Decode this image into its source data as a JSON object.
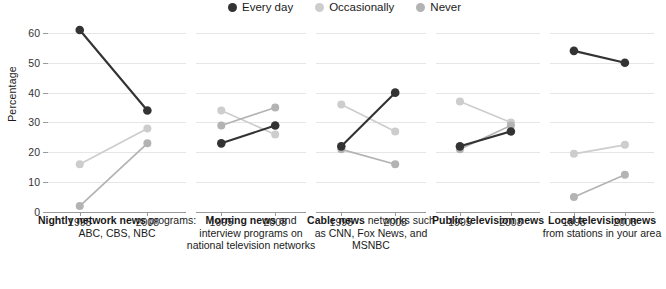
{
  "legend": {
    "items": [
      {
        "label": "Every day",
        "color": "#333333"
      },
      {
        "label": "Occasionally",
        "color": "#cdcdcd"
      },
      {
        "label": "Never",
        "color": "#b3b3b3"
      }
    ]
  },
  "axis": {
    "ylabel": "Percentage",
    "yticks": [
      "0",
      "10",
      "20",
      "30",
      "40",
      "50",
      "60"
    ],
    "xticks": [
      "1995",
      "2008"
    ]
  },
  "panels": [
    {
      "title": "Nightly network news",
      "subtitle": "programs: ABC, CBS, NBC"
    },
    {
      "title": "Morning news",
      "subtitle": "and interview programs on national television networks"
    },
    {
      "title": "Cable news",
      "subtitle": "networks such as CNN, Fox News, and MSNBC"
    },
    {
      "title": "Public television news",
      "subtitle": ""
    },
    {
      "title": "Local television news",
      "subtitle": "from stations in your area"
    }
  ],
  "chart_data": {
    "type": "line",
    "title": "",
    "xlabel": "",
    "ylabel": "Percentage",
    "ylim": [
      0,
      63
    ],
    "yticks": [
      0,
      10,
      20,
      30,
      40,
      50,
      60
    ],
    "x": [
      "1995",
      "2008"
    ],
    "grid": true,
    "legend_position": "top",
    "panels": [
      {
        "name": "Nightly network news programs: ABC, CBS, NBC",
        "series": [
          {
            "name": "Every day",
            "values": [
              61,
              34
            ],
            "color": "#333333"
          },
          {
            "name": "Occasionally",
            "values": [
              16,
              28
            ],
            "color": "#cdcdcd"
          },
          {
            "name": "Never",
            "values": [
              2,
              23
            ],
            "color": "#b3b3b3"
          }
        ]
      },
      {
        "name": "Morning news and interview programs on national television networks",
        "series": [
          {
            "name": "Every day",
            "values": [
              23,
              29
            ],
            "color": "#333333"
          },
          {
            "name": "Occasionally",
            "values": [
              34,
              26
            ],
            "color": "#cdcdcd"
          },
          {
            "name": "Never",
            "values": [
              29,
              35
            ],
            "color": "#b3b3b3"
          }
        ]
      },
      {
        "name": "Cable news networks such as CNN, Fox News, and MSNBC",
        "series": [
          {
            "name": "Every day",
            "values": [
              22,
              40
            ],
            "color": "#333333"
          },
          {
            "name": "Occasionally",
            "values": [
              36,
              27
            ],
            "color": "#cdcdcd"
          },
          {
            "name": "Never",
            "values": [
              21,
              16
            ],
            "color": "#b3b3b3"
          }
        ]
      },
      {
        "name": "Public television news",
        "series": [
          {
            "name": "Every day",
            "values": [
              22,
              27
            ],
            "color": "#333333"
          },
          {
            "name": "Occasionally",
            "values": [
              37,
              30
            ],
            "color": "#cdcdcd"
          },
          {
            "name": "Never",
            "values": [
              21,
              29
            ],
            "color": "#b3b3b3"
          }
        ]
      },
      {
        "name": "Local television news from stations in your area",
        "series": [
          {
            "name": "Every day",
            "values": [
              54,
              50
            ],
            "color": "#333333"
          },
          {
            "name": "Occasionally",
            "values": [
              19.5,
              22.5
            ],
            "color": "#cdcdcd"
          },
          {
            "name": "Never",
            "values": [
              5,
              12.5
            ],
            "color": "#b3b3b3"
          }
        ]
      }
    ]
  }
}
